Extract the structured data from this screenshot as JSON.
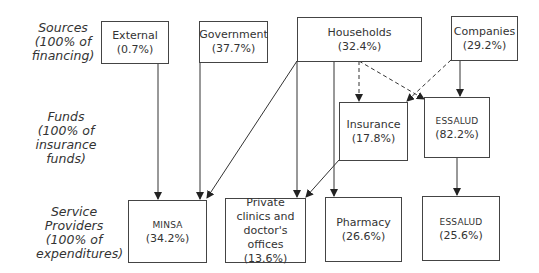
{
  "row_labels": {
    "sources": [
      "Sources",
      "(100% of",
      "financing)"
    ],
    "funds": [
      "Funds",
      "(100% of",
      "insurance funds)"
    ],
    "providers": [
      "Service",
      "Providers",
      "(100% of",
      "expenditures)"
    ]
  },
  "sources": [
    {
      "id": "external",
      "name": "External",
      "pct": "(0.7%)"
    },
    {
      "id": "government",
      "name": "Government",
      "pct": "(37.7%)"
    },
    {
      "id": "households",
      "name": "Households",
      "pct": "(32.4%)"
    },
    {
      "id": "companies",
      "name": "Companies",
      "pct": "(29.2%)"
    }
  ],
  "funds": [
    {
      "id": "insurance",
      "name": "Insurance",
      "pct": "(17.8%)"
    },
    {
      "id": "essalud_fund",
      "name": "ESSALUD",
      "pct": "(82.2%)"
    }
  ],
  "providers": [
    {
      "id": "minsa",
      "name": "MINSA",
      "pct": "(34.2%)"
    },
    {
      "id": "private",
      "name": "Private clinics and doctor's offices",
      "pct": "(13.6%)"
    },
    {
      "id": "pharmacy",
      "name": "Pharmacy",
      "pct": "(26.6%)"
    },
    {
      "id": "essalud_provider",
      "name": "ESSALUD",
      "pct": "(25.6%)"
    }
  ],
  "edges": [
    {
      "from": "external",
      "to": "minsa",
      "style": "solid"
    },
    {
      "from": "government",
      "to": "minsa",
      "style": "solid"
    },
    {
      "from": "households",
      "to": "minsa",
      "style": "solid"
    },
    {
      "from": "households",
      "to": "private",
      "style": "solid"
    },
    {
      "from": "households",
      "to": "pharmacy",
      "style": "solid"
    },
    {
      "from": "households",
      "to": "insurance",
      "style": "dashed"
    },
    {
      "from": "households",
      "to": "essalud_fund",
      "style": "dashed"
    },
    {
      "from": "companies",
      "to": "insurance",
      "style": "dashed"
    },
    {
      "from": "companies",
      "to": "essalud_fund",
      "style": "solid"
    },
    {
      "from": "insurance",
      "to": "private",
      "style": "solid"
    },
    {
      "from": "essalud_fund",
      "to": "essalud_provider",
      "style": "solid"
    }
  ],
  "colors": {
    "line": "#333333",
    "text": "#333333",
    "background": "#ffffff"
  }
}
